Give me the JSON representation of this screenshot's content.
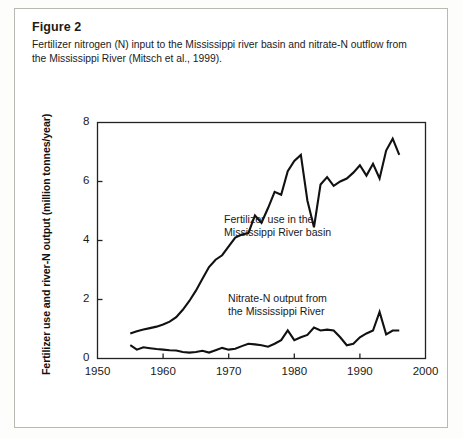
{
  "figure": {
    "label": "Figure 2",
    "caption": "Fertilizer nitrogen (N) input to the Mississippi river basin and nitrate-N outflow from the Mississippi River (Mitsch et al., 1999)."
  },
  "colors": {
    "line": "#111111",
    "axis": "#222222",
    "page_border": "#b9b9b4",
    "text": "#1b1b1b",
    "background": "#ffffff"
  },
  "annotations": {
    "fertilizer_line1": "Fertilizer use in the",
    "fertilizer_line2": "Mississippi River basin",
    "nitrate_line1": "Nitrate-N output from",
    "nitrate_line2": "the Mississippi River"
  },
  "chart_data": {
    "type": "line",
    "title": "",
    "xlabel": "",
    "ylabel": "Fertilizer use and river-N output (million tonnes/year)",
    "xlim": [
      1950,
      2000
    ],
    "ylim": [
      0,
      8
    ],
    "xticks": [
      1950,
      1960,
      1970,
      1980,
      1990,
      2000
    ],
    "yticks": [
      0,
      2,
      4,
      6,
      8
    ],
    "grid": false,
    "legend": "inline-annotations",
    "series": [
      {
        "name": "Fertilizer use in the Mississippi River basin",
        "x": [
          1955,
          1956,
          1957,
          1958,
          1959,
          1960,
          1961,
          1962,
          1963,
          1964,
          1965,
          1966,
          1967,
          1968,
          1969,
          1970,
          1971,
          1972,
          1973,
          1974,
          1975,
          1976,
          1977,
          1978,
          1979,
          1980,
          1981,
          1982,
          1983,
          1984,
          1985,
          1986,
          1987,
          1988,
          1989,
          1990,
          1991,
          1992,
          1993,
          1994,
          1995,
          1996
        ],
        "values": [
          0.85,
          0.92,
          0.98,
          1.03,
          1.08,
          1.15,
          1.25,
          1.4,
          1.65,
          1.95,
          2.3,
          2.7,
          3.1,
          3.35,
          3.5,
          3.8,
          4.1,
          4.2,
          4.25,
          4.85,
          4.6,
          5.1,
          5.65,
          5.55,
          6.35,
          6.7,
          6.9,
          5.35,
          4.45,
          5.9,
          6.15,
          5.85,
          6.0,
          6.1,
          6.3,
          6.55,
          6.2,
          6.6,
          6.1,
          7.05,
          7.45,
          6.9
        ]
      },
      {
        "name": "Nitrate-N output from the Mississippi River",
        "x": [
          1955,
          1956,
          1957,
          1958,
          1959,
          1960,
          1961,
          1962,
          1963,
          1964,
          1965,
          1966,
          1967,
          1968,
          1969,
          1970,
          1971,
          1972,
          1973,
          1974,
          1975,
          1976,
          1977,
          1978,
          1979,
          1980,
          1981,
          1982,
          1983,
          1984,
          1985,
          1986,
          1987,
          1988,
          1989,
          1990,
          1991,
          1992,
          1993,
          1994,
          1995,
          1996
        ],
        "values": [
          0.45,
          0.3,
          0.38,
          0.35,
          0.32,
          0.3,
          0.28,
          0.27,
          0.22,
          0.2,
          0.22,
          0.26,
          0.2,
          0.28,
          0.36,
          0.3,
          0.33,
          0.42,
          0.5,
          0.48,
          0.45,
          0.4,
          0.5,
          0.62,
          0.95,
          0.62,
          0.72,
          0.8,
          1.05,
          0.95,
          0.98,
          0.95,
          0.72,
          0.45,
          0.5,
          0.72,
          0.85,
          0.95,
          1.58,
          0.82,
          0.95,
          0.95
        ]
      }
    ]
  }
}
